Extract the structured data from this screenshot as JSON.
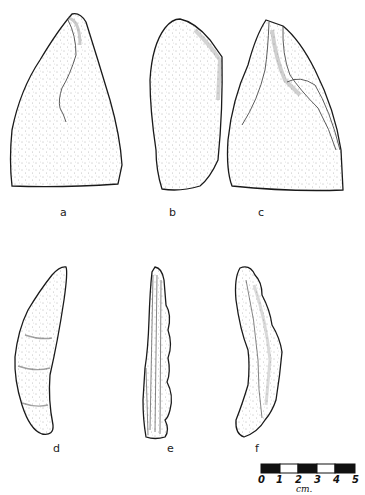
{
  "figure": {
    "type": "artifact-illustration-plate",
    "specimens": [
      {
        "id": "a",
        "label": "a"
      },
      {
        "id": "b",
        "label": "b"
      },
      {
        "id": "c",
        "label": "c"
      },
      {
        "id": "d",
        "label": "d"
      },
      {
        "id": "e",
        "label": "e"
      },
      {
        "id": "f",
        "label": "f"
      }
    ],
    "scale_bar": {
      "ticks": [
        "0",
        "1",
        "2",
        "3",
        "4",
        "5"
      ],
      "unit": "cm.",
      "segments": [
        "black",
        "white",
        "black",
        "white",
        "black"
      ]
    }
  },
  "colors": {
    "ink": "#1a1a1a",
    "paper": "#ffffff",
    "stipple": "#555555"
  }
}
